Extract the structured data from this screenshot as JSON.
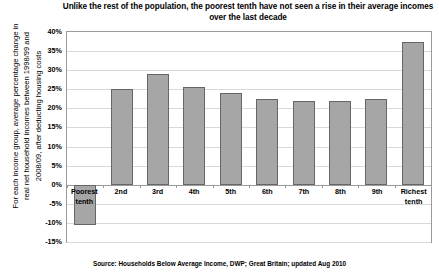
{
  "chart_data": {
    "type": "bar",
    "title": "Unlike the rest of the population, the poorest tenth have not seen a rise in their average incomes over the last decade",
    "title_line1": "Unlike the rest of the population, the poorest tenth have not seen a rise in their",
    "title_line2": "average incomes over the last decade",
    "xlabel": "",
    "ylabel": "For each income group, average percentage change in real net household incomes between 1998/99 and 2008/09, after deducting housing costs",
    "ylabel_line1": "For each income group, average percentage change in",
    "ylabel_line2": "real net household incomes between 1998/99 and",
    "ylabel_line3": "2008/09, after deducting housing costs",
    "categories": [
      "Poorest\ntenth",
      "2nd",
      "3rd",
      "4th",
      "5th",
      "6th",
      "7th",
      "8th",
      "9th",
      "Richest\ntenth"
    ],
    "values": [
      -10.5,
      25.0,
      29.0,
      25.5,
      24.0,
      22.5,
      22.0,
      21.8,
      22.5,
      37.5
    ],
    "ylim": [
      -15,
      40
    ],
    "ytick_labels": [
      "40%",
      "35%",
      "30%",
      "25%",
      "20%",
      "15%",
      "10%",
      "5%",
      "0%",
      "-5%",
      "-10%",
      "-15%"
    ],
    "ytick_values": [
      40,
      35,
      30,
      25,
      20,
      15,
      10,
      5,
      0,
      -5,
      -10,
      -15
    ],
    "grid": true,
    "legend": "none",
    "bar_color": "#a6a6a6",
    "bar_border_color": "#666666",
    "gridline_color": "#d9d9d9",
    "axis_color": "#9a9a9a",
    "source": "Source: Households Below Average Income, DWP; Great Britain; updated Aug 2010"
  }
}
